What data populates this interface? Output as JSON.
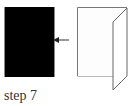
{
  "caption": {
    "text": "step 7"
  },
  "diagram": {
    "left_panel": {
      "fill": "#000000",
      "edge": "#8a8a8a"
    },
    "arrow": {
      "color": "#333333",
      "direction": "left"
    },
    "folded_paper": {
      "fill": "#ffffff",
      "stroke": "#777777"
    }
  }
}
